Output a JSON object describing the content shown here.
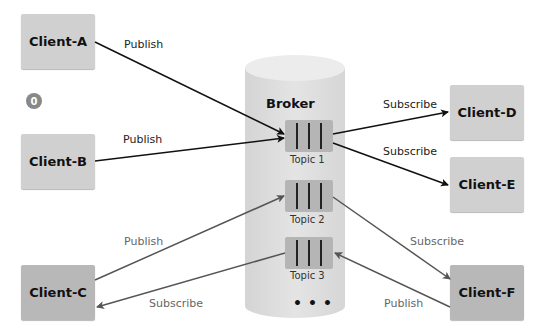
{
  "broker": {
    "title": "Broker",
    "topics": [
      {
        "label": "Topic 1"
      },
      {
        "label": "Topic 2"
      },
      {
        "label": "Topic 3"
      }
    ],
    "more": "•••"
  },
  "clients": {
    "a": "Client-A",
    "b": "Client-B",
    "c": "Client-C",
    "d": "Client-D",
    "e": "Client-E",
    "f": "Client-F"
  },
  "badge": "0",
  "edges": [
    {
      "from": "Client-A",
      "to": "Topic 1",
      "label": "Publish"
    },
    {
      "from": "Client-B",
      "to": "Topic 1",
      "label": "Publish"
    },
    {
      "from": "Topic 1",
      "to": "Client-D",
      "label": "Subscribe"
    },
    {
      "from": "Topic 1",
      "to": "Client-E",
      "label": "Subscribe"
    },
    {
      "from": "Client-C",
      "to": "Topic 2",
      "label": "Publish"
    },
    {
      "from": "Topic 3",
      "to": "Client-C",
      "label": "Subscribe"
    },
    {
      "from": "Topic 2",
      "to": "Client-F",
      "label": "Subscribe"
    },
    {
      "from": "Client-F",
      "to": "Topic 3",
      "label": "Publish"
    }
  ],
  "colors": {
    "client_fill": "#d0d0d0",
    "client_fill_dark": "#b8b8b8",
    "broker_fill": "#dedede",
    "topic_fill": "#b5b5b5",
    "arrow_dark": "#111111",
    "arrow_muted": "#555555"
  }
}
